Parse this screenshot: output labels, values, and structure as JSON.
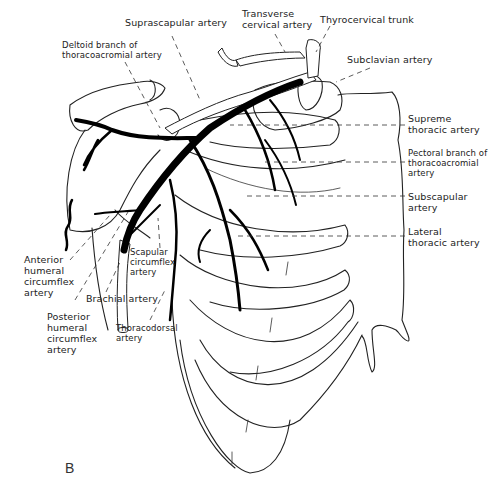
{
  "figure": {
    "panel_label": "B"
  },
  "labels": {
    "suprascapular": "Suprascapular artery",
    "transverse_cervical": "Transverse\ncervical artery",
    "thyrocervical": "Thyrocervical trunk",
    "deltoid_branch": "Deltoid branch of\nthoracoacromial artery",
    "subclavian": "Subclavian artery",
    "supreme_thoracic": "Supreme\nthoracic artery",
    "pectoral_branch": "Pectoral branch of\nthoracoacromial\nartery",
    "subscapular": "Subscapular\nartery",
    "lateral_thoracic": "Lateral\nthoracic artery",
    "anterior_humeral_circumflex": "Anterior\nhumeral\ncircumflex\nartery",
    "scapular_circumflex": "Scapular\ncircumflex\nartery",
    "brachial": "Brachial artery",
    "posterior_humeral_circumflex": "Posterior\nhumeral\ncircumflex\nartery",
    "thoracodorsal": "Thoracodorsal\nartery"
  },
  "colors": {
    "background": "#ffffff",
    "ink": "#000000",
    "label_text": "#222222"
  }
}
